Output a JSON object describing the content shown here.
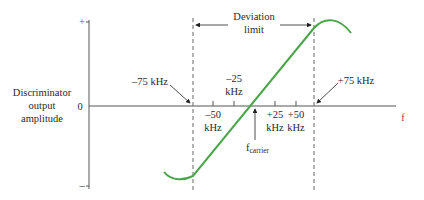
{
  "diagram": {
    "y_axis": {
      "label_lines": [
        "Discriminator",
        "output",
        "amplitude"
      ],
      "plus_sign": "+",
      "zero": "0",
      "minus_sign": "–"
    },
    "x_axis": {
      "label": "f",
      "ticks": [
        {
          "line1": "–50",
          "line2": "kHz"
        },
        {
          "line1": "–25",
          "line2": "kHz"
        },
        {
          "line1": "+25",
          "line2": "kHz"
        },
        {
          "line1": "+50",
          "line2": "kHz"
        }
      ],
      "carrier_label": "f",
      "carrier_subscript": "carrier"
    },
    "limits": {
      "left_label": "–75 kHz",
      "right_label": "+75 kHz",
      "deviation_line1": "Deviation",
      "deviation_line2": "limit"
    },
    "colors": {
      "curve": "#4aa54a",
      "axis": "#555555",
      "dashed": "#666666",
      "sign": "#b0304a"
    }
  }
}
